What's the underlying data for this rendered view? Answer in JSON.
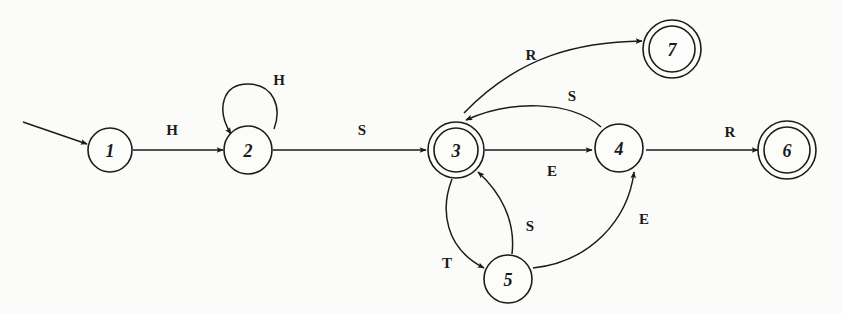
{
  "diagram": {
    "type": "finite-state-automaton",
    "start_state": "1",
    "states": [
      {
        "id": "1",
        "label": "1",
        "accepting": false
      },
      {
        "id": "2",
        "label": "2",
        "accepting": false
      },
      {
        "id": "3",
        "label": "3",
        "accepting": true
      },
      {
        "id": "4",
        "label": "4",
        "accepting": false
      },
      {
        "id": "5",
        "label": "5",
        "accepting": false
      },
      {
        "id": "6",
        "label": "6",
        "accepting": true
      },
      {
        "id": "7",
        "label": "7",
        "accepting": true
      }
    ],
    "transitions": [
      {
        "from": "1",
        "to": "2",
        "label": "H"
      },
      {
        "from": "2",
        "to": "2",
        "label": "H"
      },
      {
        "from": "2",
        "to": "3",
        "label": "S"
      },
      {
        "from": "3",
        "to": "7",
        "label": "R"
      },
      {
        "from": "3",
        "to": "4",
        "label": "E"
      },
      {
        "from": "4",
        "to": "3",
        "label": "S"
      },
      {
        "from": "4",
        "to": "6",
        "label": "R"
      },
      {
        "from": "3",
        "to": "5",
        "label": "T"
      },
      {
        "from": "5",
        "to": "3",
        "label": "S"
      },
      {
        "from": "5",
        "to": "4",
        "label": "E"
      }
    ]
  }
}
